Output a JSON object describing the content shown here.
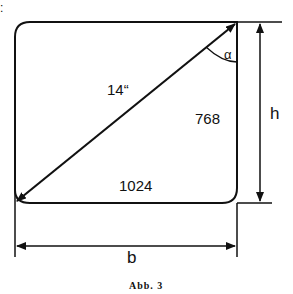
{
  "figure": {
    "prefix_mark": ":",
    "diagonal_label": "14“",
    "height_pixels_label": "768",
    "width_pixels_label": "1024",
    "angle_label": "α",
    "height_dim_label": "h",
    "width_dim_label": "b",
    "caption": "Abb.  3"
  },
  "colors": {
    "stroke": "#111111",
    "background": "#ffffff"
  }
}
